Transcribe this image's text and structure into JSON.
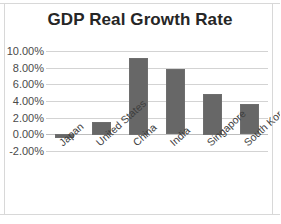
{
  "chart_data": {
    "type": "bar",
    "title": "GDP Real Growth Rate",
    "xlabel": "",
    "ylabel": "",
    "categories": [
      "Japan",
      "United States",
      "China",
      "India",
      "Singapore",
      "South Korea"
    ],
    "values": [
      -0.5,
      1.5,
      9.2,
      7.8,
      4.9,
      3.6
    ],
    "value_unit": "percent",
    "ylim": [
      -2,
      10
    ],
    "ytick_values": [
      10,
      8,
      6,
      4,
      2,
      0,
      -2
    ],
    "ytick_labels": [
      "10.00%",
      "8.00%",
      "6.00%",
      "4.00%",
      "2.00%",
      "0.00%",
      "-2.00%"
    ],
    "grid": true,
    "legend": false,
    "bar_color": "#676767",
    "gridline_color": "#d3d3d3",
    "title_color": "#262626",
    "axis_label_color": "#4a4a4a"
  }
}
